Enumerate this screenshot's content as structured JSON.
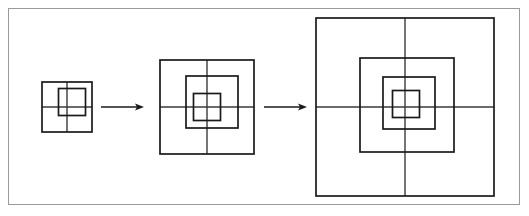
{
  "figure": {
    "background_color": "#ffffff",
    "frame": {
      "name": "outer-border",
      "color": "#9a9a9a",
      "stroke_width": 1,
      "x": 8,
      "y": 8,
      "width": 512,
      "height": 197
    },
    "line_color": "#1a1a1a",
    "axis_color": "#3a3a3a",
    "center_y": 107,
    "stages": [
      {
        "label": "stage-1",
        "index": 1,
        "center_x": 67,
        "center_y": 107,
        "outer_size": 50,
        "square_count": 2,
        "squares": [
          {
            "name": "square-outer",
            "cx": 67,
            "cy": 107,
            "size": 50,
            "stroke_width": 1.7
          },
          {
            "name": "square-inner",
            "cx": 72,
            "cy": 102,
            "size": 27,
            "stroke_width": 1.7
          }
        ],
        "axes": {
          "horizontal": {
            "x1": 42,
            "x2": 92,
            "y": 107
          },
          "vertical": {
            "y1": 82,
            "y2": 132,
            "x": 67
          }
        }
      },
      {
        "label": "stage-2",
        "index": 2,
        "center_x": 207,
        "center_y": 107,
        "outer_size": 94,
        "square_count": 3,
        "squares": [
          {
            "name": "square-outer",
            "cx": 207,
            "cy": 107,
            "size": 94,
            "stroke_width": 1.7
          },
          {
            "name": "square-middle",
            "cx": 212,
            "cy": 102,
            "size": 52,
            "stroke_width": 1.7
          },
          {
            "name": "square-inner",
            "cx": 207,
            "cy": 107,
            "size": 27,
            "stroke_width": 1.7
          }
        ],
        "axes": {
          "horizontal": {
            "x1": 160,
            "x2": 254,
            "y": 107
          },
          "vertical": {
            "y1": 60,
            "y2": 154,
            "x": 207
          }
        }
      },
      {
        "label": "stage-3",
        "index": 3,
        "center_x": 405,
        "center_y": 107,
        "outer_size": 178,
        "square_count": 4,
        "squares": [
          {
            "name": "square-outer",
            "cx": 405,
            "cy": 107,
            "size": 178,
            "stroke_width": 1.7
          },
          {
            "name": "square-second",
            "cx": 407,
            "cy": 105,
            "size": 94,
            "stroke_width": 1.7
          },
          {
            "name": "square-third",
            "cx": 409,
            "cy": 103,
            "size": 52,
            "stroke_width": 1.7
          },
          {
            "name": "square-inner",
            "cx": 406,
            "cy": 104,
            "size": 27,
            "stroke_width": 1.7
          }
        ],
        "axes": {
          "horizontal": {
            "x1": 316,
            "x2": 494,
            "y": 107
          },
          "vertical": {
            "y1": 18,
            "y2": 196,
            "x": 405
          }
        }
      }
    ],
    "arrows": [
      {
        "name": "arrow-stage1-to-stage2",
        "x1": 101,
        "x2": 144,
        "y": 107,
        "stroke_width": 1.4,
        "head_length": 9,
        "head_width": 7
      },
      {
        "name": "arrow-stage2-to-stage3",
        "x1": 264,
        "x2": 307,
        "y": 107,
        "stroke_width": 1.4,
        "head_length": 9,
        "head_width": 7
      }
    ]
  }
}
